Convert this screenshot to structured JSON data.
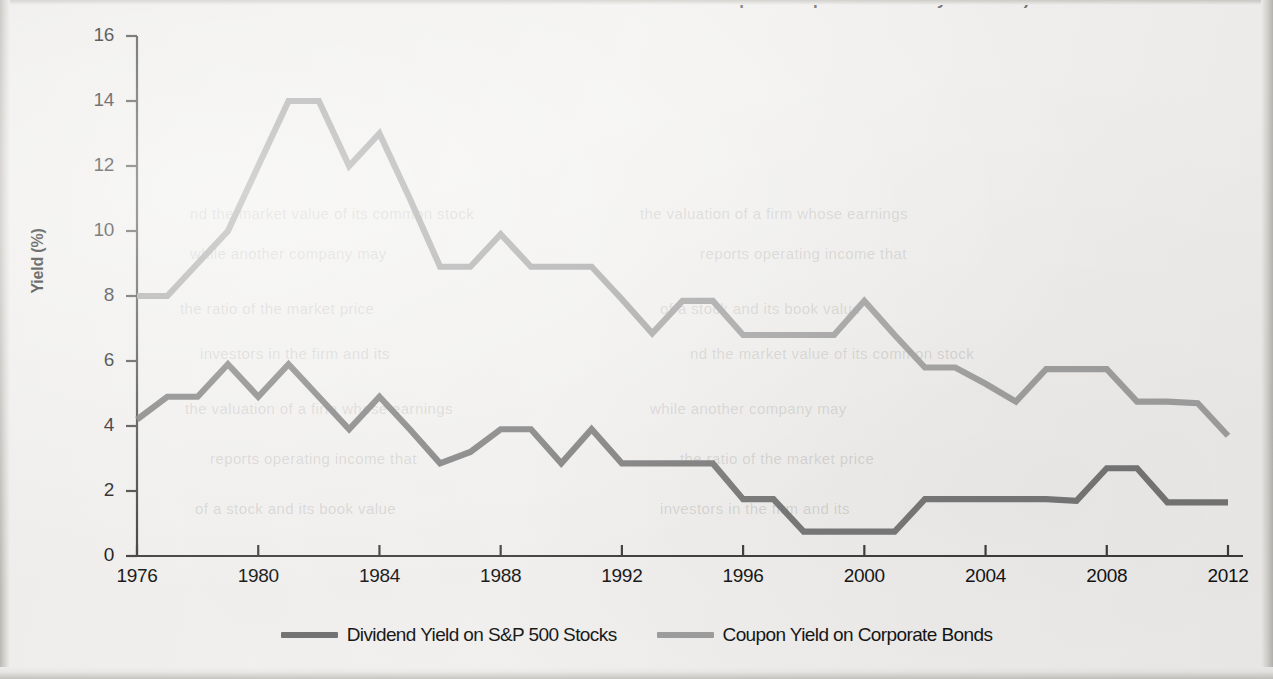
{
  "page": {
    "clipped_top_caption": "...and www.multpl.com/s-p-500-dividend-yield/table.)",
    "background_color": "#f2f1ef"
  },
  "ghost_text_lines": [
    "nd the market value of its common stock",
    "the valuation of a firm whose earnings",
    "while another company may",
    "reports operating income that",
    "the ratio of the market price",
    "of a stock and its book value",
    "investors in the firm and its"
  ],
  "chart_data": {
    "type": "line",
    "title": "",
    "xlabel": "",
    "ylabel": "Yield (%)",
    "xlim": [
      1976,
      2012
    ],
    "ylim": [
      0,
      16
    ],
    "ytick_step": 2,
    "xtick_step": 4,
    "yticks": [
      "0",
      "2",
      "4",
      "6",
      "8",
      "10",
      "12",
      "14",
      "16"
    ],
    "xticks": [
      "1976",
      "1980",
      "1984",
      "1988",
      "1992",
      "1996",
      "2000",
      "2004",
      "2008",
      "2012"
    ],
    "grid": false,
    "legend_position": "bottom-center",
    "x": [
      1976,
      1977,
      1978,
      1979,
      1980,
      1981,
      1982,
      1983,
      1984,
      1985,
      1986,
      1987,
      1988,
      1989,
      1990,
      1991,
      1992,
      1993,
      1994,
      1995,
      1996,
      1997,
      1998,
      1999,
      2000,
      2001,
      2002,
      2003,
      2004,
      2005,
      2006,
      2007,
      2008,
      2009,
      2010,
      2011,
      2012
    ],
    "series": [
      {
        "name": "Dividend Yield on S&P 500 Stocks",
        "color": "#6f6f6f",
        "values": [
          4.2,
          4.9,
          4.9,
          5.9,
          4.9,
          5.9,
          4.9,
          3.9,
          4.9,
          3.9,
          2.85,
          3.2,
          3.9,
          3.9,
          2.85,
          3.9,
          2.85,
          2.85,
          2.85,
          2.85,
          1.75,
          1.75,
          0.75,
          0.75,
          0.75,
          0.75,
          1.75,
          1.75,
          1.75,
          1.75,
          1.75,
          1.7,
          2.7,
          2.7,
          1.65,
          1.65,
          1.65
        ]
      },
      {
        "name": "Coupon Yield on Corporate Bonds",
        "color": "#9b9b9b",
        "values": [
          8.0,
          8.0,
          9.0,
          10.0,
          12.0,
          14.0,
          14.0,
          12.0,
          13.0,
          11.0,
          8.9,
          8.9,
          9.9,
          8.9,
          8.9,
          8.9,
          7.9,
          6.85,
          7.85,
          7.85,
          6.8,
          6.8,
          6.8,
          6.8,
          7.85,
          6.8,
          5.8,
          5.8,
          5.3,
          4.75,
          5.75,
          5.75,
          5.75,
          4.75,
          4.75,
          4.7,
          3.7
        ]
      }
    ],
    "legend": [
      {
        "label": "Dividend Yield on S&P 500 Stocks",
        "color": "#6f6f6f"
      },
      {
        "label": "Coupon Yield on Corporate Bonds",
        "color": "#9b9b9b"
      }
    ],
    "axis_color": "#3a3a3a"
  }
}
